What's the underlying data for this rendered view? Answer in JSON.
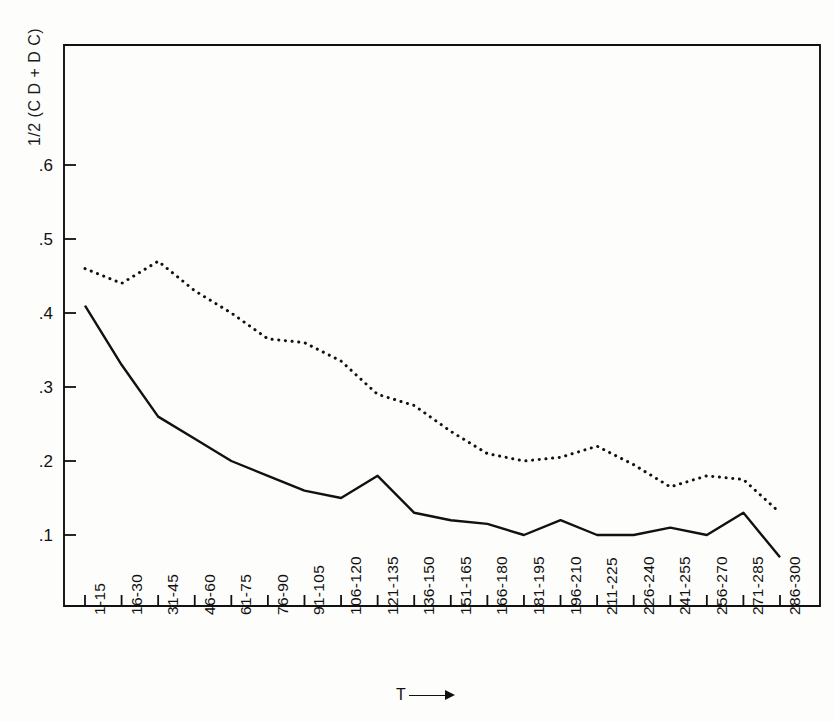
{
  "chart_data": {
    "type": "line",
    "title": "",
    "ylabel": "1/2 (C D + D C)",
    "xlabel": "T",
    "xlabel_arrow": "⟶",
    "grid": false,
    "legend": "none",
    "ylim": [
      0,
      0.68
    ],
    "ytick_labels": [
      ".6",
      ".5",
      ".4",
      ".3",
      ".2",
      ".1"
    ],
    "ytick_values": [
      0.6,
      0.5,
      0.4,
      0.3,
      0.2,
      0.1
    ],
    "categories": [
      "1-15",
      "16-30",
      "31-45",
      "46-60",
      "61-75",
      "76-90",
      "91-105",
      "106-120",
      "121-135",
      "136-150",
      "151-165",
      "166-180",
      "181-195",
      "196-210",
      "211-225",
      "226-240",
      "241-255",
      "256-270",
      "271-285",
      "286-300"
    ],
    "series": [
      {
        "name": "solid-curve",
        "style": "solid",
        "color": "#111111",
        "values": [
          0.41,
          0.33,
          0.26,
          0.23,
          0.2,
          0.18,
          0.16,
          0.15,
          0.18,
          0.13,
          0.12,
          0.115,
          0.1,
          0.12,
          0.1,
          0.1,
          0.11,
          0.1,
          0.13,
          0.07
        ]
      },
      {
        "name": "dotted-curve",
        "style": "dotted",
        "color": "#111111",
        "values": [
          0.46,
          0.44,
          0.47,
          0.43,
          0.4,
          0.365,
          0.36,
          0.335,
          0.29,
          0.275,
          0.24,
          0.21,
          0.2,
          0.205,
          0.22,
          0.195,
          0.165,
          0.18,
          0.175,
          0.13
        ]
      }
    ]
  }
}
